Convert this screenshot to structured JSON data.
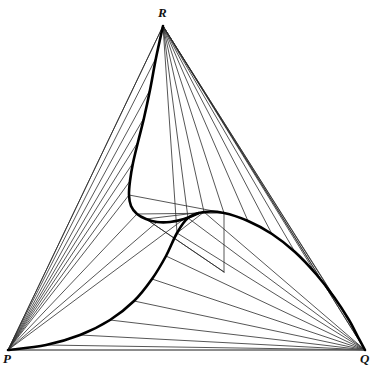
{
  "figure": {
    "type": "geometric-diagram",
    "background_color": "#ffffff",
    "thin_line_color": "#2b2b2b",
    "thick_line_color": "#000000",
    "baseline_color": "#6e6e6e",
    "thin_line_width": 0.8,
    "thick_line_width": 2.6,
    "baseline_width": 1.0
  },
  "labels": {
    "apex": "R",
    "bottom_left": "P",
    "bottom_right": "Q"
  },
  "chart_data": {
    "type": "scatter",
    "xlabel": "",
    "ylabel": "",
    "grid": false,
    "legend": null,
    "vertices": {
      "P": [
        8,
        350
      ],
      "Q": [
        365,
        350
      ],
      "R": [
        163,
        26
      ]
    },
    "triangle_edges": [
      {
        "name": "PR",
        "from": [
          8,
          350
        ],
        "to": [
          163,
          26
        ]
      },
      {
        "name": "RQ",
        "from": [
          163,
          26
        ],
        "to": [
          365,
          350
        ]
      },
      {
        "name": "PQ",
        "from": [
          8,
          350
        ],
        "to": [
          365,
          350
        ]
      }
    ],
    "spiral_points": [
      [
        8,
        350
      ],
      [
        46,
        345
      ],
      [
        80,
        335
      ],
      [
        110,
        320
      ],
      [
        134,
        301
      ],
      [
        152,
        279
      ],
      [
        166,
        256
      ],
      [
        177,
        233
      ],
      [
        188,
        218
      ],
      [
        204,
        212
      ],
      [
        224,
        213
      ],
      [
        248,
        221
      ],
      [
        272,
        234
      ],
      [
        295,
        252
      ],
      [
        316,
        274
      ],
      [
        334,
        297
      ],
      [
        349,
        320
      ],
      [
        358,
        337
      ],
      [
        365,
        350
      ]
    ],
    "spiral_upper_points": [
      [
        163,
        26
      ],
      [
        156,
        58
      ],
      [
        150,
        90
      ],
      [
        144,
        118
      ],
      [
        138,
        142
      ],
      [
        133,
        163
      ],
      [
        130,
        181
      ],
      [
        129,
        195
      ],
      [
        131,
        206
      ],
      [
        137,
        214
      ],
      [
        146,
        219
      ],
      [
        157,
        222
      ],
      [
        170,
        222
      ],
      [
        184,
        219
      ],
      [
        199,
        213
      ]
    ],
    "fan_from_P": [
      {
        "to": [
          163,
          26
        ]
      },
      {
        "to": [
          156,
          58
        ]
      },
      {
        "to": [
          150,
          90
        ]
      },
      {
        "to": [
          144,
          118
        ]
      },
      {
        "to": [
          138,
          142
        ]
      },
      {
        "to": [
          133,
          163
        ]
      },
      {
        "to": [
          130,
          181
        ]
      },
      {
        "to": [
          129,
          195
        ]
      },
      {
        "to": [
          137,
          214
        ]
      },
      {
        "to": [
          157,
          222
        ]
      },
      {
        "to": [
          184,
          219
        ]
      }
    ],
    "fan_from_R": [
      {
        "to": [
          365,
          350
        ]
      },
      {
        "to": [
          349,
          320
        ]
      },
      {
        "to": [
          334,
          297
        ]
      },
      {
        "to": [
          316,
          274
        ]
      },
      {
        "to": [
          295,
          252
        ]
      },
      {
        "to": [
          272,
          234
        ]
      },
      {
        "to": [
          248,
          221
        ]
      },
      {
        "to": [
          224,
          213
        ]
      },
      {
        "to": [
          204,
          212
        ]
      },
      {
        "to": [
          188,
          218
        ]
      },
      {
        "to": [
          177,
          233
        ]
      }
    ],
    "fan_from_Q": [
      {
        "to": [
          8,
          350
        ]
      },
      {
        "to": [
          46,
          345
        ]
      },
      {
        "to": [
          80,
          335
        ]
      },
      {
        "to": [
          110,
          320
        ]
      },
      {
        "to": [
          134,
          301
        ]
      },
      {
        "to": [
          152,
          279
        ]
      },
      {
        "to": [
          166,
          256
        ]
      },
      {
        "to": [
          177,
          233
        ]
      },
      {
        "to": [
          188,
          218
        ]
      },
      {
        "to": [
          204,
          212
        ]
      }
    ],
    "inner_chords": [
      {
        "from": [
          129,
          195
        ],
        "to": [
          224,
          213
        ]
      },
      {
        "from": [
          224,
          213
        ],
        "to": [
          224,
          272
        ]
      },
      {
        "from": [
          224,
          272
        ],
        "to": [
          146,
          219
        ]
      },
      {
        "from": [
          146,
          219
        ],
        "to": [
          204,
          212
        ]
      },
      {
        "from": [
          204,
          212
        ],
        "to": [
          177,
          233
        ]
      },
      {
        "from": [
          137,
          214
        ],
        "to": [
          224,
          213
        ]
      },
      {
        "from": [
          146,
          219
        ],
        "to": [
          224,
          272
        ]
      }
    ],
    "xlim": [
      0,
      379
    ],
    "ylim": [
      0,
      364
    ]
  }
}
